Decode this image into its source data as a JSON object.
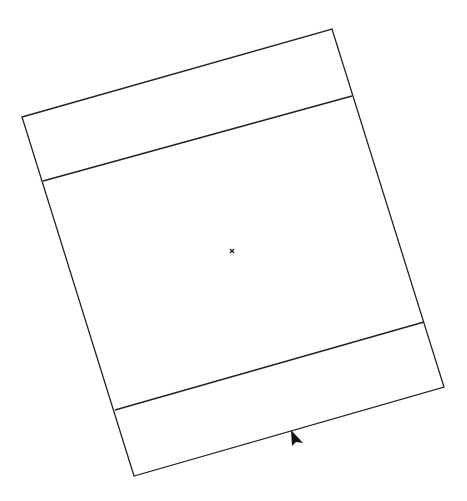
{
  "canvas": {
    "width": 467,
    "height": 501,
    "background": "#ffffff",
    "stroke_color": "#222222"
  },
  "shape": {
    "type": "rotated-rectangle",
    "corners": {
      "top_left": [
        22,
        117
      ],
      "top_right": [
        332,
        29
      ],
      "bottom_right": [
        444,
        387
      ],
      "bottom_left": [
        134,
        476
      ]
    },
    "divider_lines": [
      {
        "name": "top-band-divider",
        "from": [
          43,
          181
        ],
        "to": [
          352,
          96
        ]
      },
      {
        "name": "bottom-band-divider",
        "from": [
          115,
          410
        ],
        "to": [
          424,
          322
        ]
      }
    ]
  },
  "center_marker": {
    "glyph": "×",
    "position": [
      232,
      251
    ]
  },
  "cursor": {
    "type": "arrow-pointer",
    "position": [
      290,
      432
    ]
  }
}
